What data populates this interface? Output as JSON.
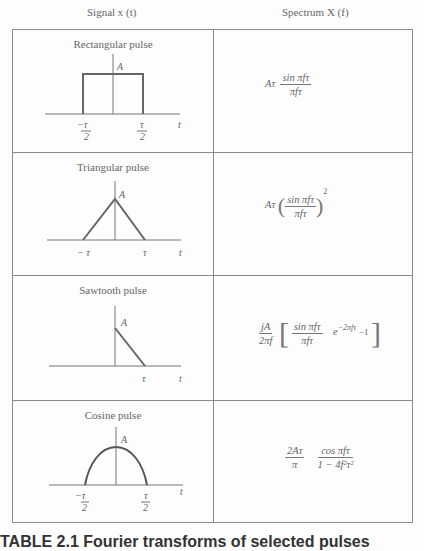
{
  "header": {
    "signal_col": "Signal x (t)",
    "spectrum_col": "Spectrum X (f)"
  },
  "rows": [
    {
      "title": "Rectangular pulse",
      "amplitude_label": "A",
      "tick_left": "−τ/2",
      "tick_right": "τ/2",
      "axis_label": "t",
      "spectrum": {
        "prefix": "Aτ",
        "num": "sin πfτ",
        "den": "πfτ"
      }
    },
    {
      "title": "Triangular pulse",
      "amplitude_label": "A",
      "tick_left": "−τ",
      "tick_right": "τ",
      "axis_label": "t",
      "spectrum": {
        "prefix": "Aτ",
        "num": "sin πfτ",
        "den": "πfτ",
        "power": "2"
      }
    },
    {
      "title": "Sawtooth pulse",
      "amplitude_label": "A",
      "tick_right": "τ",
      "axis_label": "t",
      "spectrum": {
        "coef_num": "jA",
        "coef_den": "2πf",
        "num": "sin πfτ",
        "den": "πfτ",
        "exp_base": "e",
        "exp_power": "−2πfτ",
        "tail": "−1"
      }
    },
    {
      "title": "Cosine pulse",
      "amplitude_label": "A",
      "tick_left": "−τ/2",
      "tick_right": "τ/2",
      "axis_label": "t",
      "spectrum": {
        "coef_num": "2Aτ",
        "coef_den": "π",
        "num": "cos πfτ",
        "den": "1 − 4f²τ²"
      }
    }
  ],
  "caption": "TABLE 2.1  Fourier transforms of selected pulses"
}
